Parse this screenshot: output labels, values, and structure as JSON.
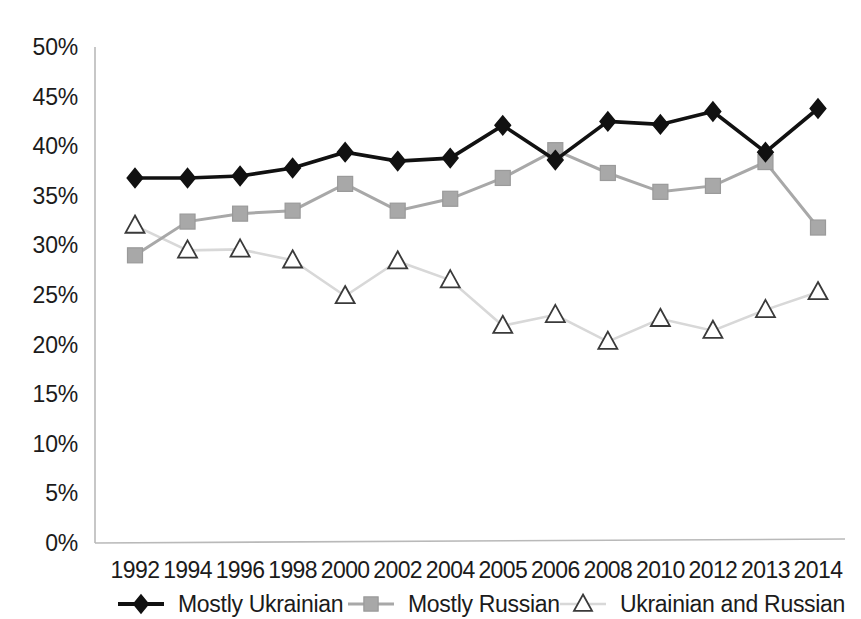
{
  "chart_data": {
    "type": "line",
    "title": "",
    "subtitle": "",
    "xlabel": "",
    "ylabel": "",
    "categories": [
      "1992",
      "1994",
      "1996",
      "1998",
      "2000",
      "2002",
      "2004",
      "2005",
      "2006",
      "2008",
      "2010",
      "2012",
      "2013",
      "2014"
    ],
    "ylim": [
      0,
      50
    ],
    "ytick_step": 5,
    "ytick_labels": [
      "0%",
      "5%",
      "10%",
      "15%",
      "20%",
      "25%",
      "30%",
      "35%",
      "40%",
      "45%",
      "50%"
    ],
    "ytick_values": [
      0,
      5,
      10,
      15,
      20,
      25,
      30,
      35,
      40,
      45,
      50
    ],
    "grid": false,
    "legend_position": "bottom",
    "value_suffix": "%",
    "series": [
      {
        "name": "Mostly Ukrainian",
        "color": "#111111",
        "marker": "diamond",
        "line_width": 3.6,
        "values": [
          36.8,
          36.8,
          37.0,
          37.8,
          39.4,
          38.5,
          38.8,
          42.1,
          38.6,
          42.5,
          42.2,
          43.5,
          39.4,
          43.8
        ]
      },
      {
        "name": "Mostly Russian",
        "color": "#a8a8a8",
        "marker": "square",
        "line_width": 3.0,
        "values": [
          29.0,
          32.4,
          33.2,
          33.5,
          36.2,
          33.5,
          34.7,
          36.8,
          39.6,
          37.3,
          35.4,
          36.0,
          38.4,
          31.8
        ]
      },
      {
        "name": "Ukrainian and Russian",
        "color": "#d8d8d8",
        "marker": "triangle",
        "line_width": 2.6,
        "values": [
          32.0,
          29.5,
          29.6,
          28.5,
          24.9,
          28.4,
          26.5,
          21.9,
          23.0,
          20.3,
          22.6,
          21.4,
          23.5,
          25.3
        ]
      }
    ]
  },
  "legend": {
    "items": [
      {
        "label": "Mostly Ukrainian",
        "marker": "diamond",
        "color": "#111111"
      },
      {
        "label": "Mostly Russian",
        "marker": "square",
        "color": "#a8a8a8"
      },
      {
        "label": "Ukrainian and Russian",
        "marker": "triangle",
        "color": "#d8d8d8"
      }
    ]
  }
}
